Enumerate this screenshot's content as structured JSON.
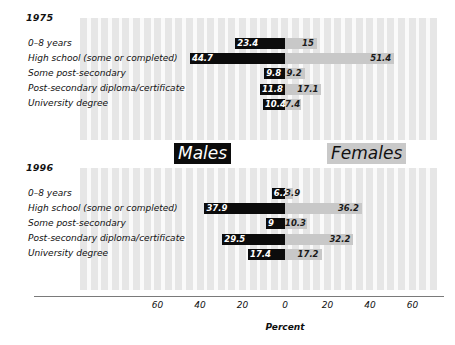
{
  "chart_data": {
    "type": "bar",
    "subtype": "diverging-population-pyramid",
    "title": "",
    "xlabel": "Percent",
    "ylabel": "",
    "xlim": [
      -70,
      70
    ],
    "grid": false,
    "legend_position": "inside-center",
    "axis_ticks": [
      "60",
      "40",
      "20",
      "0",
      "20",
      "40",
      "60"
    ],
    "axis_tick_values": [
      -60,
      -40,
      -20,
      0,
      20,
      40,
      60
    ],
    "series_labels": {
      "left": "Males",
      "right": "Females"
    },
    "categories": [
      "0–8 years",
      "High school (some or completed)",
      "Some post-secondary",
      "Post-secondary diploma/certificate",
      "University degree"
    ],
    "panels": [
      {
        "year": "1975",
        "series": [
          {
            "name": "Males",
            "values": [
              23.4,
              44.7,
              9.8,
              11.8,
              10.4
            ],
            "labels": [
              "23.4",
              "44.7",
              "9.8",
              "11.8",
              "10.4"
            ]
          },
          {
            "name": "Females",
            "values": [
              15,
              51.4,
              9.2,
              17.1,
              7.4
            ],
            "labels": [
              "15",
              "51.4",
              "9.2",
              "17.1",
              "7.4"
            ]
          }
        ]
      },
      {
        "year": "1996",
        "series": [
          {
            "name": "Males",
            "values": [
              6.2,
              37.9,
              9,
              29.5,
              17.4
            ],
            "labels": [
              "6.2",
              "37.9",
              "9",
              "29.5",
              "17.4"
            ]
          },
          {
            "name": "Females",
            "values": [
              3.9,
              36.2,
              10.3,
              32.2,
              17.2
            ],
            "labels": [
              "3.9",
              "36.2",
              "10.3",
              "32.2",
              "17.2"
            ]
          }
        ]
      }
    ],
    "colors": {
      "male_bar": "#0c0c0c",
      "female_bar": "#c8c8c8",
      "plot_stripe_dark": "#e6e6e6",
      "plot_stripe_light": "#fafafa",
      "axis_line": "#7a7a7a",
      "text": "#121212"
    }
  }
}
